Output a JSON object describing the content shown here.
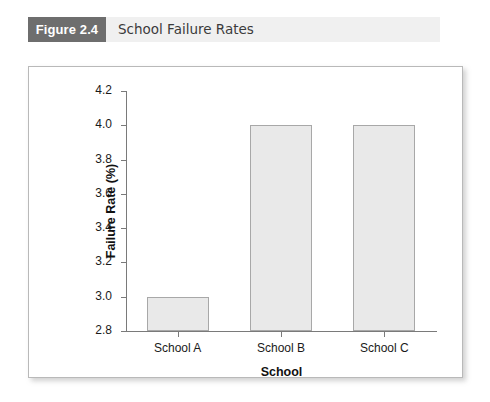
{
  "figure": {
    "label": "Figure 2.4",
    "title": "School Failure Rates"
  },
  "colors": {
    "label_box": "#6e6e6e",
    "caption_band": "#f0f0f0",
    "bar_fill": "#e9e9e9",
    "bar_border": "#a8a8a8",
    "axis": "#7a7a7a",
    "panel_border": "#b9b9b9"
  },
  "chart_data": {
    "type": "bar",
    "title": "School Failure Rates",
    "categories": [
      "School A",
      "School B",
      "School C"
    ],
    "values": [
      3.0,
      4.0,
      4.0
    ],
    "xlabel": "School",
    "ylabel": "Failure Rate (%)",
    "ylim": [
      2.8,
      4.2
    ],
    "ytick_labels": [
      "2.8",
      "3.0",
      "3.2",
      "3.4",
      "3.6",
      "3.8",
      "4.0",
      "4.2"
    ],
    "ytick_values": [
      2.8,
      3.0,
      3.2,
      3.4,
      3.6,
      3.8,
      4.0,
      4.2
    ],
    "grid": false,
    "legend": false
  }
}
